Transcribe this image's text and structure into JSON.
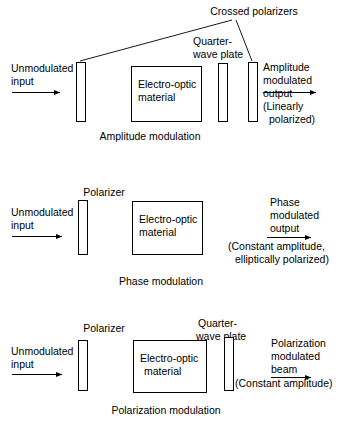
{
  "figure": {
    "title_top_label": "Crossed polarizers",
    "sections": [
      {
        "id": "amplitude",
        "caption": "Amplitude modulation",
        "input_label_line1": "Unmodulated",
        "input_label_line2": "input",
        "plate_label_line1": "Quarter-",
        "plate_label_line2": "wave plate",
        "material_line1": "Electro-optic",
        "material_line2": "material",
        "output_line1": "Amplitude",
        "output_line2": "modulated",
        "output_line3": "output",
        "output_line4": "(Linearly",
        "output_line5": "polarized)"
      },
      {
        "id": "phase",
        "caption": "Phase modulation",
        "input_label_line1": "Unmodulated",
        "input_label_line2": "input",
        "polarizer_label": "Polarizer",
        "material_line1": "Electro-optic",
        "material_line2": "material",
        "output_line1": "Phase",
        "output_line2": "modulated",
        "output_line3": "output",
        "output_line4": "(Constant amplitude,",
        "output_line5": "elliptically polarized)"
      },
      {
        "id": "polarization",
        "caption": "Polarization modulation",
        "input_label_line1": "Unmodulated",
        "input_label_line2": "input",
        "polarizer_label": "Polarizer",
        "plate_label_line1": "Quarter-",
        "plate_label_line2": "wave plate",
        "material_line1": "Electro-optic",
        "material_line2": "material",
        "output_line1": "Polarization",
        "output_line2": "modulated",
        "output_line3": "beam",
        "output_line4": "(Constant amplitude)"
      }
    ],
    "colors": {
      "background": "#ffffff",
      "stroke": "#000000",
      "text": "#000000"
    }
  }
}
